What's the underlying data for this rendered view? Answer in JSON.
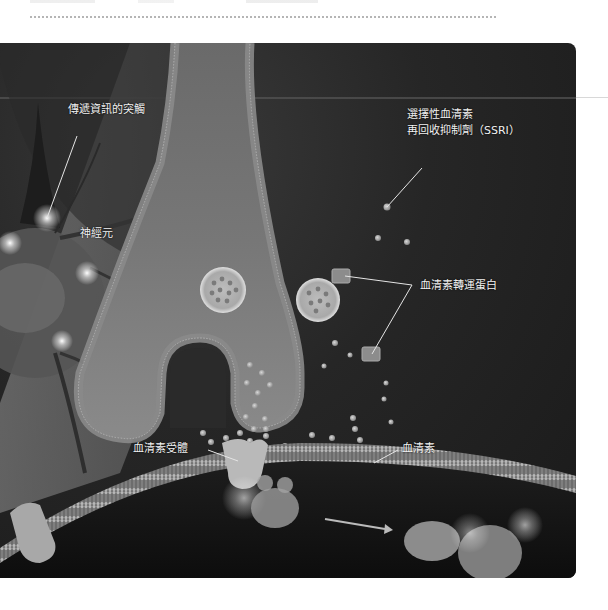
{
  "figure": {
    "labels": {
      "synapse": "傳遞資訊的突觸",
      "neuron": "神經元",
      "ssri_line1": "選擇性血清素",
      "ssri_line2": "再回收抑制劑（SSRI）",
      "transporter": "血清素轉運蛋白",
      "receptor": "血清素受體",
      "serotonin": "血清素"
    }
  }
}
